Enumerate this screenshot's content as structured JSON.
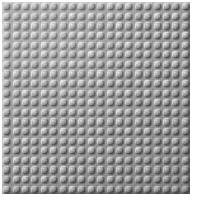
{
  "image": {
    "subject": "lego-baseplate",
    "description": "Grey LEGO-style building plate viewed straight on, filling most of the frame on a white background",
    "background_color": "#ffffff"
  },
  "baseplate": {
    "label": "Grey LEGO baseplate",
    "base_color": "#9c9c9c",
    "stud_highlight_color": "#c6c6c6",
    "stud_shadow_color": "#767676",
    "edge_highlight_color": "#bdbdbd",
    "edge_shadow_color": "#6e6e6e",
    "columns": 20,
    "rows": 20,
    "total_studs": 400,
    "left_px": 2,
    "top_px": 2,
    "width_px": 188,
    "height_px": 192,
    "stud_pitch_x_px": 9.4,
    "stud_pitch_y_px": 9.6,
    "stud_shape": "rounded-square",
    "stud_corner_radius_pct": 30,
    "light_direction": "upper-left"
  },
  "canvas": {
    "width_px": 197,
    "height_px": 203
  }
}
